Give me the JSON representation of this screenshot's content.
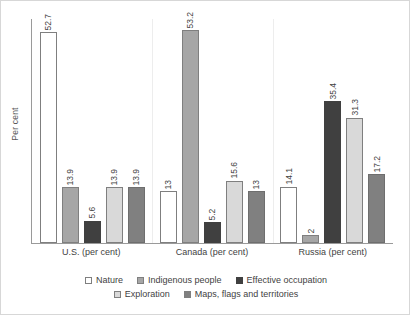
{
  "chart_data": {
    "type": "bar",
    "title": "",
    "subtitle": "",
    "xlabel": "",
    "ylabel": "Per cent",
    "ylim": [
      0,
      56
    ],
    "grid": false,
    "legend_position": "bottom",
    "categories": [
      "U.S. (per cent)",
      "Canada (per cent)",
      "Russia (per cent)"
    ],
    "series": [
      {
        "name": "Nature",
        "values": [
          52.7,
          13,
          14.1
        ],
        "labels": [
          "52.7",
          "13",
          "14.1"
        ],
        "color": "#ffffff"
      },
      {
        "name": "Indigenous people",
        "values": [
          13.9,
          53.2,
          2
        ],
        "labels": [
          "13.9",
          "53.2",
          "2"
        ],
        "color": "#a6a6a6"
      },
      {
        "name": "Effective occupation",
        "values": [
          5.6,
          5.2,
          35.4
        ],
        "labels": [
          "5.6",
          "5.2",
          "35.4"
        ],
        "color": "#404040"
      },
      {
        "name": "Exploration",
        "values": [
          13.9,
          15.6,
          31.3
        ],
        "labels": [
          "13.9",
          "15.6",
          "31.3"
        ],
        "color": "#d9d9d9"
      },
      {
        "name": "Maps, flags and territories",
        "values": [
          13.9,
          13,
          17.2
        ],
        "labels": [
          "13.9",
          "13",
          "17.2"
        ],
        "color": "#808080"
      }
    ]
  },
  "axis": {
    "y_title": "Per cent",
    "axis_line_color": "#9a9a9a"
  },
  "legend": {
    "rows": [
      [
        "Nature",
        "Indigenous people",
        "Effective occupation"
      ],
      [
        "Exploration",
        "Maps, flags and territories"
      ]
    ]
  }
}
